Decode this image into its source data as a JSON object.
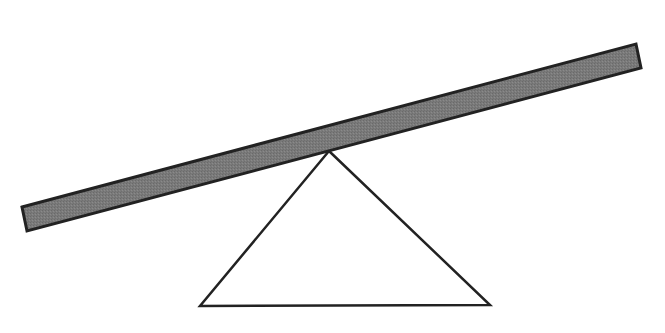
{
  "diagram": {
    "type": "seesaw-lever",
    "canvas": {
      "width": 665,
      "height": 333,
      "background": "#ffffff"
    },
    "plank": {
      "points": [
        [
          22,
          207
        ],
        [
          636,
          44
        ],
        [
          641,
          68
        ],
        [
          27,
          231
        ]
      ],
      "fill": "#7a7a7a",
      "stroke": "#222222",
      "stroke_width": 3
    },
    "fulcrum": {
      "shape": "triangle",
      "points": [
        [
          329,
          151
        ],
        [
          490,
          305
        ],
        [
          200,
          306
        ]
      ],
      "fill": "#ffffff",
      "stroke": "#222222",
      "stroke_width": 2.5
    }
  }
}
